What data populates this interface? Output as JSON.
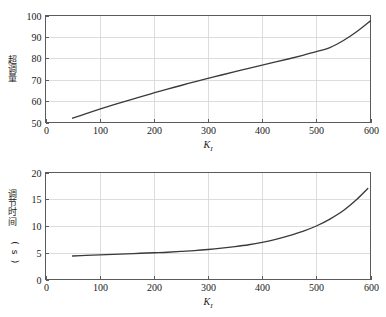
{
  "figure": {
    "background_color": "#ffffff",
    "curve_color": "#3a3a3a",
    "grid_color": "#d4d4d4",
    "axis_color": "#5b5b5b"
  },
  "chart_data": [
    {
      "type": "line",
      "panel": "top",
      "title": "",
      "xlabel": "K_I",
      "xlabel_base": "K",
      "xlabel_sub": "I",
      "ylabel": "超调量",
      "xlim": [
        0,
        600
      ],
      "ylim": [
        50,
        100
      ],
      "grid": true,
      "legend": "none",
      "xticks": [
        0,
        100,
        200,
        300,
        400,
        500,
        600
      ],
      "xticklabels": [
        "0",
        "100",
        "200",
        "300",
        "400",
        "500",
        "600"
      ],
      "yticks": [
        50,
        60,
        70,
        80,
        90,
        100
      ],
      "yticklabels": [
        "50",
        "60",
        "70",
        "80",
        "90",
        "100"
      ],
      "x": [
        50,
        75,
        100,
        125,
        150,
        175,
        200,
        225,
        250,
        275,
        300,
        325,
        350,
        375,
        400,
        425,
        450,
        475,
        500,
        525,
        550,
        575,
        600
      ],
      "y": [
        52.0,
        54.1,
        56.2,
        58.2,
        60.1,
        62.0,
        63.8,
        65.6,
        67.3,
        69.0,
        70.6,
        72.2,
        73.8,
        75.3,
        76.8,
        78.3,
        79.8,
        81.4,
        83.1,
        85.0,
        88.3,
        92.5,
        97.5
      ]
    },
    {
      "type": "line",
      "panel": "bottom",
      "title": "",
      "xlabel": "K_I",
      "xlabel_base": "K",
      "xlabel_sub": "I",
      "ylabel": "调节时间 (s)",
      "xlim": [
        0,
        600
      ],
      "ylim": [
        0,
        20
      ],
      "grid": true,
      "legend": "none",
      "xticks": [
        0,
        100,
        200,
        300,
        400,
        500,
        600
      ],
      "xticklabels": [
        "0",
        "100",
        "200",
        "300",
        "400",
        "500",
        "600"
      ],
      "yticks": [
        0,
        5,
        10,
        15,
        20
      ],
      "yticklabels": [
        "0",
        "5",
        "10",
        "15",
        "20"
      ],
      "x": [
        50,
        75,
        100,
        125,
        150,
        175,
        200,
        225,
        250,
        275,
        300,
        325,
        350,
        375,
        400,
        425,
        450,
        475,
        500,
        525,
        550,
        575,
        595
      ],
      "y": [
        4.4,
        4.5,
        4.6,
        4.7,
        4.8,
        4.9,
        5.0,
        5.1,
        5.25,
        5.4,
        5.6,
        5.85,
        6.15,
        6.5,
        6.95,
        7.5,
        8.2,
        9.0,
        10.0,
        11.3,
        12.9,
        15.0,
        17.0
      ]
    }
  ]
}
